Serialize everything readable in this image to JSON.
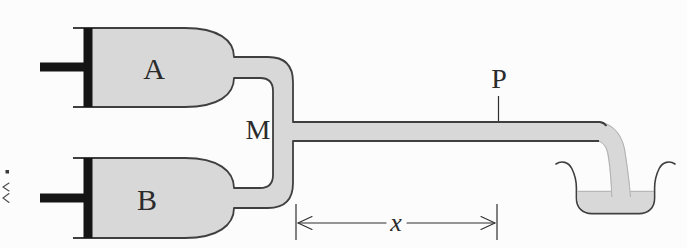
{
  "figure": {
    "labels": {
      "syringe_a": "A",
      "syringe_b": "B",
      "mixing_point": "M",
      "observation_point": "P",
      "distance": "x"
    },
    "colors": {
      "glass_fill": "#d8d8d8",
      "liquid_fill": "#d8d8d8",
      "outline": "#3f3f3f",
      "plunger_black": "#151515",
      "background": "#fcfcfc",
      "label_color": "#2b2b2b"
    }
  }
}
